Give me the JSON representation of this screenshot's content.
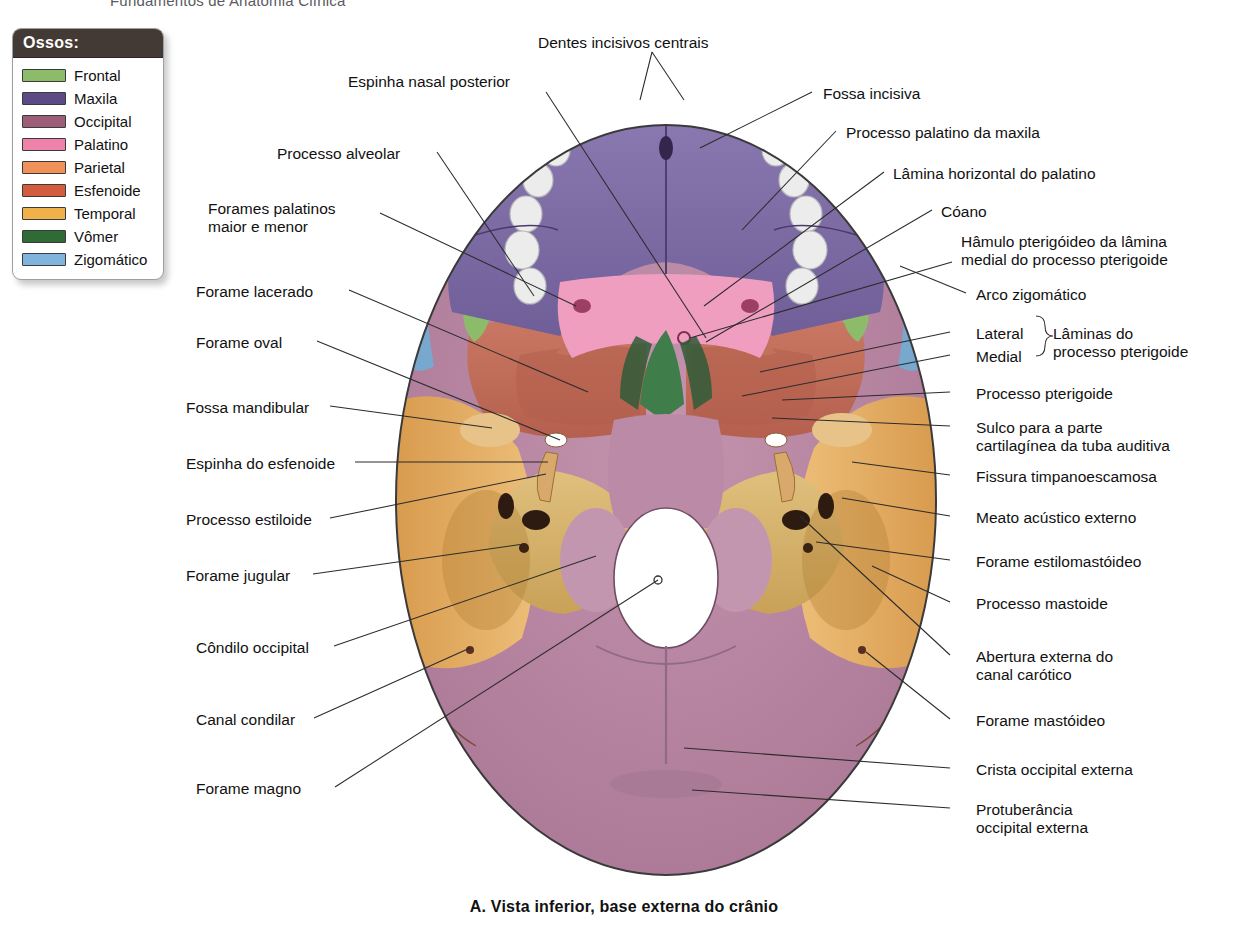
{
  "running_header": "Fundamentos de Anatomia Clínica",
  "legend": {
    "title": "Ossos:",
    "items": [
      {
        "label": "Frontal",
        "color": "#8cbb6a"
      },
      {
        "label": "Maxila",
        "color": "#5c4a87"
      },
      {
        "label": "Occipital",
        "color": "#9c5d78"
      },
      {
        "label": "Palatino",
        "color": "#ef82ab"
      },
      {
        "label": "Parietal",
        "color": "#ef9158"
      },
      {
        "label": "Esfenoide",
        "color": "#d35c3e"
      },
      {
        "label": "Temporal",
        "color": "#f0b04a"
      },
      {
        "label": "Vômer",
        "color": "#2e6b35"
      },
      {
        "label": "Zigomático",
        "color": "#7fb4de"
      }
    ]
  },
  "caption": "A. Vista inferior, base externa do crânio",
  "labels_top": [
    {
      "id": "dentes-incisivos-centrais",
      "text": "Dentes incisivos centrais",
      "x": 538,
      "y": 34
    },
    {
      "id": "espinha-nasal-posterior",
      "text": "Espinha nasal posterior",
      "x": 348,
      "y": 73
    }
  ],
  "labels_left": [
    {
      "id": "processo-alveolar",
      "text": "Processo alveolar",
      "x": 277,
      "y": 145
    },
    {
      "id": "forames-palatinos",
      "text": "Forames palatinos\nmaior e menor",
      "x": 208,
      "y": 200
    },
    {
      "id": "forame-lacerado",
      "text": "Forame lacerado",
      "x": 196,
      "y": 283
    },
    {
      "id": "forame-oval",
      "text": "Forame oval",
      "x": 196,
      "y": 334
    },
    {
      "id": "fossa-mandibular",
      "text": "Fossa mandibular",
      "x": 186,
      "y": 399
    },
    {
      "id": "espinha-do-esfenoide",
      "text": "Espinha do esfenoide",
      "x": 186,
      "y": 455
    },
    {
      "id": "processo-estiloide",
      "text": "Processo estiloide",
      "x": 186,
      "y": 511
    },
    {
      "id": "forame-jugular",
      "text": "Forame jugular",
      "x": 186,
      "y": 567
    },
    {
      "id": "condilo-occipital",
      "text": "Côndilo occipital",
      "x": 196,
      "y": 639
    },
    {
      "id": "canal-condilar",
      "text": "Canal condilar",
      "x": 196,
      "y": 711
    },
    {
      "id": "forame-magno",
      "text": "Forame magno",
      "x": 196,
      "y": 780
    }
  ],
  "labels_right": [
    {
      "id": "fossa-incisiva",
      "text": "Fossa incisiva",
      "x": 823,
      "y": 85
    },
    {
      "id": "processo-palatino-maxila",
      "text": "Processo palatino da maxila",
      "x": 846,
      "y": 124
    },
    {
      "id": "lamina-horizontal-palatino",
      "text": "Lâmina horizontal do palatino",
      "x": 893,
      "y": 165
    },
    {
      "id": "coano",
      "text": "Cóano",
      "x": 941,
      "y": 203
    },
    {
      "id": "hamulo-pterigoideo",
      "text": "Hâmulo pterigóideo da lâmina\nmedial do processo pterigoide",
      "x": 961,
      "y": 233
    },
    {
      "id": "arco-zigomatico",
      "text": "Arco zigomático",
      "x": 976,
      "y": 286
    },
    {
      "id": "lateral",
      "text": "Lateral",
      "x": 976,
      "y": 325
    },
    {
      "id": "medial",
      "text": "Medial",
      "x": 976,
      "y": 348
    },
    {
      "id": "laminas-processo-pterigoide",
      "text": "Lâminas do\nprocesso pterigoide",
      "x": 1053,
      "y": 325
    },
    {
      "id": "processo-pterigoide",
      "text": "Processo pterigoide",
      "x": 976,
      "y": 385
    },
    {
      "id": "sulco-tuba-auditiva",
      "text": "Sulco para a parte\ncartilagínea da tuba auditiva",
      "x": 976,
      "y": 419
    },
    {
      "id": "fissura-timpanoescamosa",
      "text": "Fissura timpanoescamosa",
      "x": 976,
      "y": 468
    },
    {
      "id": "meato-acustico-externo",
      "text": "Meato acústico externo",
      "x": 976,
      "y": 509
    },
    {
      "id": "forame-estilomastoideo",
      "text": "Forame estilomastóideo",
      "x": 976,
      "y": 553
    },
    {
      "id": "processo-mastoide",
      "text": "Processo mastoide",
      "x": 976,
      "y": 595
    },
    {
      "id": "abertura-canal-carotico",
      "text": "Abertura externa do\ncanal carótico",
      "x": 976,
      "y": 648
    },
    {
      "id": "forame-mastoideo",
      "text": "Forame mastóideo",
      "x": 976,
      "y": 712
    },
    {
      "id": "crista-occipital-externa",
      "text": "Crista occipital externa",
      "x": 976,
      "y": 761
    },
    {
      "id": "protuberancia-occipital",
      "text": "Protuberância\noccipital externa",
      "x": 976,
      "y": 801
    }
  ],
  "colors": {
    "frontal": "#8cbb6a",
    "maxila": "#7d6ba5",
    "occipital": "#b5819c",
    "palatino": "#f09ec0",
    "parietal": "#e79a74",
    "esfenoide": "#c07060",
    "temporal": "#e0a85e",
    "vomer": "#3f7d4a",
    "zigomatico": "#79a8cf",
    "teeth": "#e9e9ea",
    "outline": "#3a3a3a",
    "leader": "#2b2b2b"
  }
}
